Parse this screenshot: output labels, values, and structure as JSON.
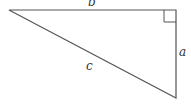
{
  "diagram": {
    "type": "right-triangle",
    "stroke_color": "#555555",
    "labels": {
      "top_side": "b",
      "right_side": "a",
      "hypotenuse": "c"
    },
    "right_angle_marker": true
  }
}
